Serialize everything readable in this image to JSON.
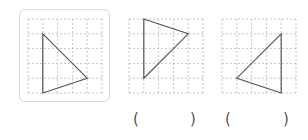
{
  "figure": {
    "grid": {
      "cols": 5,
      "rows": 5,
      "line_color": "#b8b8b8",
      "shape_color": "#555555"
    },
    "panels": [
      {
        "id": "reference",
        "framed": true,
        "origin": [
          28,
          19
        ],
        "cell": 14.8,
        "triangle": [
          [
            1,
            1
          ],
          [
            4,
            4
          ],
          [
            1,
            5
          ]
        ],
        "answer": null
      },
      {
        "id": "option-a",
        "framed": false,
        "origin": [
          129,
          19
        ],
        "cell": 14.8,
        "triangle": [
          [
            1,
            0
          ],
          [
            4,
            1
          ],
          [
            1,
            4
          ]
        ],
        "answer": {
          "open": "(",
          "close": ")",
          "value": ""
        }
      },
      {
        "id": "option-b",
        "framed": false,
        "origin": [
          222,
          19
        ],
        "cell": 14.8,
        "triangle": [
          [
            4,
            1
          ],
          [
            1,
            4
          ],
          [
            4,
            5
          ]
        ],
        "answer": {
          "open": "(",
          "close": ")",
          "value": ""
        }
      }
    ]
  }
}
